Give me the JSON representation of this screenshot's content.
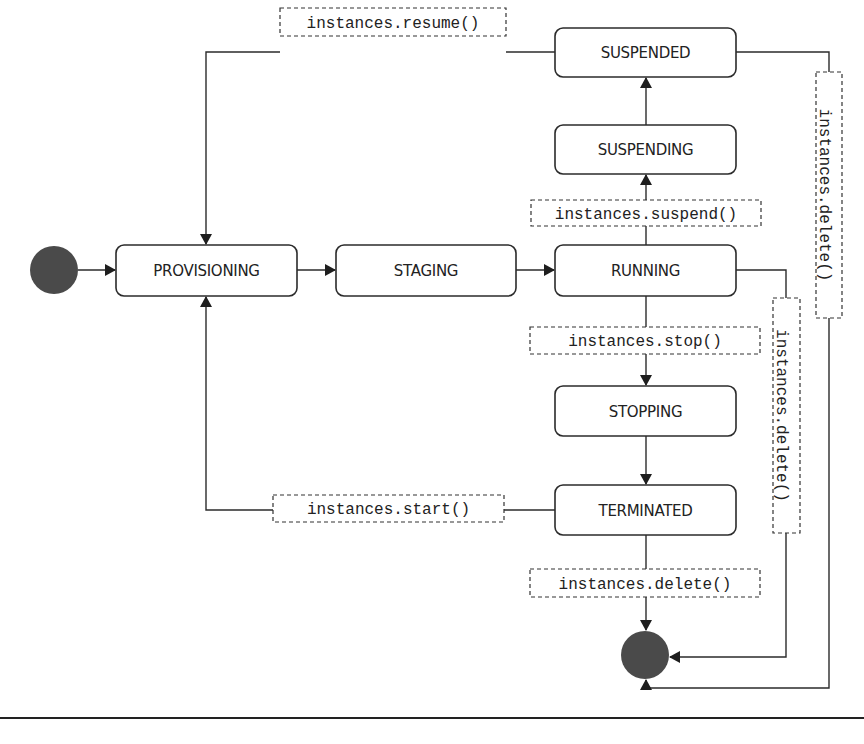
{
  "diagram": {
    "title": "",
    "states": {
      "provisioning": "PROVISIONING",
      "staging": "STAGING",
      "running": "RUNNING",
      "suspending": "SUSPENDING",
      "suspended": "SUSPENDED",
      "stopping": "STOPPING",
      "terminated": "TERMINATED"
    },
    "transitions": {
      "resume": "instances.resume()",
      "suspend": "instances.suspend()",
      "stop": "instances.stop()",
      "start": "instances.start()",
      "delete_from_terminated": "instances.delete()",
      "delete_from_running": "instances.delete()",
      "delete_from_suspended": "instances.delete()"
    },
    "pseudo_states": {
      "initial": "initial-state",
      "final": "final-state"
    },
    "colors": {
      "stroke": "#2b2b2b",
      "pseudo_fill": "#4a4a4a",
      "background": "#ffffff"
    }
  }
}
